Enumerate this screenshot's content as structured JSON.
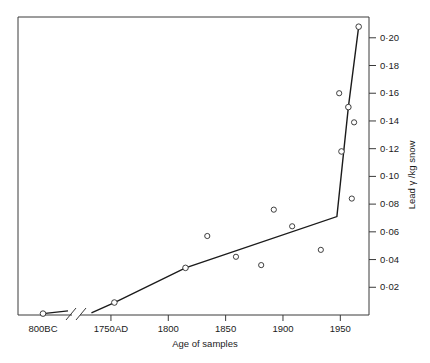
{
  "chart_data": {
    "type": "line",
    "title": "",
    "xlabel": "Age of samples",
    "ylabel": "Lead γ /kg snow",
    "xlim": [
      1730,
      1975
    ],
    "ylim": [
      0,
      0.215
    ],
    "grid": false,
    "legend": "none",
    "axis_break": {
      "present": true,
      "note": "x axis broken between 800BC and 1750AD"
    },
    "xticks": [
      {
        "label": "800BC",
        "value": -800,
        "segment": "ancient"
      },
      {
        "label": "1750AD",
        "value": 1750,
        "segment": "modern"
      },
      {
        "label": "1800",
        "value": 1800,
        "segment": "modern"
      },
      {
        "label": "1850",
        "value": 1850,
        "segment": "modern"
      },
      {
        "label": "1900",
        "value": 1900,
        "segment": "modern"
      },
      {
        "label": "1950",
        "value": 1950,
        "segment": "modern"
      }
    ],
    "yticks": [
      {
        "label": "0·02",
        "value": 0.02
      },
      {
        "label": "0·04",
        "value": 0.04
      },
      {
        "label": "0·06",
        "value": 0.06
      },
      {
        "label": "0·08",
        "value": 0.08
      },
      {
        "label": "0·10",
        "value": 0.1
      },
      {
        "label": "0·12",
        "value": 0.12
      },
      {
        "label": "0·14",
        "value": 0.14
      },
      {
        "label": "0·16",
        "value": 0.16
      },
      {
        "label": "0·18",
        "value": 0.18
      },
      {
        "label": "0·20",
        "value": 0.2
      }
    ],
    "series": [
      {
        "name": "trend",
        "type": "line",
        "segment": "ancient",
        "points": [
          {
            "x": -800,
            "y": 0.001
          },
          {
            "x": -300,
            "y": 0.003
          }
        ]
      },
      {
        "name": "trend",
        "type": "line",
        "segment": "modern",
        "points": [
          {
            "x": 1733,
            "y": 0.0015
          },
          {
            "x": 1753,
            "y": 0.009
          },
          {
            "x": 1815,
            "y": 0.034
          },
          {
            "x": 1947,
            "y": 0.071
          },
          {
            "x": 1957,
            "y": 0.15
          },
          {
            "x": 1966,
            "y": 0.208
          }
        ]
      }
    ],
    "markers_on_line": [
      {
        "x": -800,
        "y": 0.001,
        "segment": "ancient"
      },
      {
        "x": 1753,
        "y": 0.009,
        "segment": "modern"
      },
      {
        "x": 1815,
        "y": 0.034,
        "segment": "modern"
      },
      {
        "x": 1951,
        "y": 0.118,
        "segment": "modern"
      },
      {
        "x": 1957,
        "y": 0.15,
        "segment": "modern"
      },
      {
        "x": 1966,
        "y": 0.208,
        "segment": "modern"
      }
    ],
    "scatter_points": [
      {
        "x": 1834,
        "y": 0.057
      },
      {
        "x": 1859,
        "y": 0.042
      },
      {
        "x": 1881,
        "y": 0.036
      },
      {
        "x": 1892,
        "y": 0.076
      },
      {
        "x": 1908,
        "y": 0.064
      },
      {
        "x": 1933,
        "y": 0.047
      },
      {
        "x": 1949,
        "y": 0.16
      },
      {
        "x": 1960,
        "y": 0.084
      },
      {
        "x": 1962,
        "y": 0.139
      }
    ],
    "colors": {
      "line": "#1b1b1b",
      "marker_stroke": "#2a2a2a",
      "marker_fill": "#ffffff",
      "axis": "#3a3a3a",
      "text": "#1b1b1b",
      "background": "#ffffff"
    }
  }
}
